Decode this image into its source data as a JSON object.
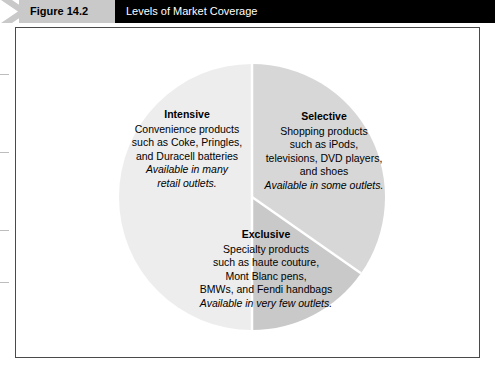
{
  "header": {
    "figure_label": "Figure 14.2",
    "title": "Levels of Market Coverage",
    "tab_color": "#c9c9c9",
    "bar_color": "#000000",
    "title_color": "#ffffff"
  },
  "chart_data": {
    "type": "pie",
    "title": "Levels of Market Coverage",
    "legend": "none",
    "grid": false,
    "center": [
      252,
      197
    ],
    "radius": 133,
    "slices": [
      {
        "name": "Intensive",
        "value": 33.3,
        "start_angle_deg": 180,
        "end_angle_deg": 360,
        "color": "#ededed",
        "label": {
          "title": "Intensive",
          "lines": [
            "Convenience products",
            "such as Coke, Pringles,",
            "and Duracell batteries"
          ],
          "italic_lines": [
            "Available in many",
            "retail outlets."
          ]
        }
      },
      {
        "name": "Selective",
        "value": 33.3,
        "start_angle_deg": 0,
        "end_angle_deg": 125,
        "color": "#d7d7d7",
        "label": {
          "title": "Selective",
          "lines": [
            "Shopping products",
            "such as iPods,",
            "televisions, DVD players,",
            "and shoes"
          ],
          "italic_lines": [
            "Available in some outlets."
          ]
        }
      },
      {
        "name": "Exclusive",
        "value": 33.4,
        "start_angle_deg": 125,
        "end_angle_deg": 180,
        "color": "#c9c9c9",
        "label": {
          "title": "Exclusive",
          "lines": [
            "Specialty products",
            "such as haute couture,",
            "Mont Blanc pens,",
            "BMWs, and Fendi handbags"
          ],
          "italic_lines": [
            "Available in very few outlets."
          ]
        }
      }
    ],
    "divider_color": "#ffffff",
    "background": "#ffffff"
  }
}
